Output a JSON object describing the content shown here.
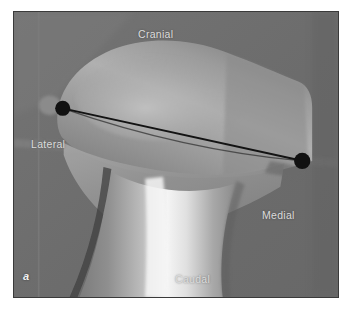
{
  "figure": {
    "panel_letter": "a",
    "caption_absent": true,
    "modality": "radiograph",
    "frame_border_color": "#3a3a3a",
    "background_color": "#6d6d6d"
  },
  "orientation_labels": [
    {
      "id": "cranial",
      "text": "Cranial",
      "color": "#dcdcdc",
      "x": 151,
      "y": 22
    },
    {
      "id": "lateral",
      "text": "Lateral",
      "color": "#dcdcdc",
      "x": 36,
      "y": 132
    },
    {
      "id": "medial",
      "text": "Medial",
      "color": "#dcdcdc",
      "x": 270,
      "y": 203
    },
    {
      "id": "caudal",
      "text": "Caudal",
      "color": "#dcdcdc",
      "x": 181,
      "y": 267
    }
  ],
  "markers": [
    {
      "id": "lateral-landmark",
      "label": "lateral landmark point",
      "shape": "filled-circle",
      "color": "#111111",
      "x": 62,
      "y": 108,
      "radius": 7.5
    },
    {
      "id": "medial-landmark",
      "label": "medial landmark point",
      "shape": "filled-circle",
      "color": "#111111",
      "x": 303,
      "y": 161,
      "radius": 8.0
    }
  ],
  "measurement_lines": [
    {
      "id": "primary-axis-line",
      "label": "joint orientation line",
      "color": "#141414",
      "width": 1.8,
      "x1": 62,
      "y1": 108,
      "x2": 303,
      "y2": 161
    },
    {
      "id": "secondary-reference-line",
      "label": "secondary reference line",
      "color": "#3d3d3d",
      "width": 1.2,
      "x1": 62,
      "y1": 108,
      "x2": 303,
      "y2": 161,
      "sag": 9
    }
  ],
  "anatomy": {
    "regions": [
      {
        "id": "soft-tissue-background",
        "label": "soft tissue background",
        "tone": "#6d6d6d"
      },
      {
        "id": "proximal-epiphysis",
        "label": "proximal tibial epiphysis",
        "tone": "#9a9a9a"
      },
      {
        "id": "tibial-plateau",
        "label": "tibial plateau",
        "tone": "#adadad"
      },
      {
        "id": "metaphysis",
        "label": "tibial metaphysis",
        "tone": "#8f8f8f"
      },
      {
        "id": "tibial-shaft",
        "label": "tibial shaft (diaphysis)",
        "tone": "#b6b6b6"
      },
      {
        "id": "cortical-highlight",
        "label": "cortical bone highlight",
        "tone": "#f2f2f2"
      },
      {
        "id": "lateral-tubercle",
        "label": "lateral tubercle",
        "tone": "#8a8a8a"
      },
      {
        "id": "horizontal-tissue-edge",
        "label": "soft tissue boundary",
        "tone": "#7a7a7a"
      },
      {
        "id": "vertical-collimation-edge",
        "label": "collimation edge",
        "tone": "#7d7d7d"
      }
    ]
  }
}
